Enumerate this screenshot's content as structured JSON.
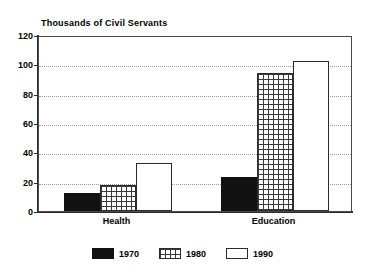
{
  "chart_data": {
    "type": "bar",
    "title": "Thousands of Civil Servants",
    "xlabel": "",
    "ylabel": "",
    "ylim": [
      0,
      120
    ],
    "yticks": [
      0,
      20,
      40,
      60,
      80,
      100,
      120
    ],
    "grid": true,
    "legend_position": "bottom",
    "categories": [
      "Health",
      "Education"
    ],
    "series": [
      {
        "name": "1970",
        "values": [
          12,
          23
        ],
        "fill": "solid",
        "color": "#111111"
      },
      {
        "name": "1980",
        "values": [
          18,
          94
        ],
        "fill": "hatch",
        "color": "#3a3a3a"
      },
      {
        "name": "1990",
        "values": [
          33,
          102
        ],
        "fill": "empty",
        "color": "#ffffff"
      }
    ]
  }
}
